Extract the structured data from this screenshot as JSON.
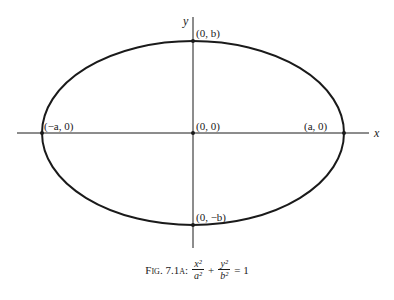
{
  "diagram": {
    "axes": {
      "x_label": "x",
      "y_label": "y"
    },
    "points": {
      "top": "(0, b)",
      "origin": "(0, 0)",
      "left": "(−a, 0)",
      "right": "(a, 0)",
      "bottom": "(0, −b)"
    },
    "caption": {
      "prefix": "Fig. 7.1a:",
      "term1_num": "x²",
      "term1_den": "a²",
      "plus": "+",
      "term2_num": "y²",
      "term2_den": "b²",
      "equals": "= 1"
    },
    "colors": {
      "stroke": "#1a1a1a",
      "background": "#ffffff"
    }
  }
}
